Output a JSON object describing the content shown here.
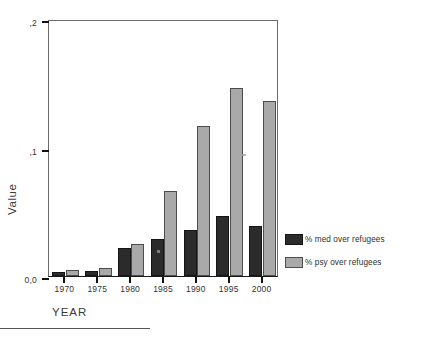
{
  "chart_data": {
    "type": "bar",
    "title": "",
    "subtitle": "",
    "xlabel": "YEAR",
    "ylabel": "Value",
    "categories": [
      "1970",
      "1975",
      "1980",
      "1985",
      "1990",
      "1995",
      "2000"
    ],
    "series": [
      {
        "name": "% med over refugees",
        "color": "#2b2b2b",
        "values": [
          0.003,
          0.004,
          0.022,
          0.029,
          0.036,
          0.047,
          0.039
        ]
      },
      {
        "name": "% psy over refugees",
        "color": "#a9a9a9",
        "values": [
          0.005,
          0.006,
          0.025,
          0.066,
          0.117,
          0.146,
          0.136
        ]
      }
    ],
    "ylim": [
      0.0,
      0.2
    ],
    "ytick_values": [
      0.0,
      0.1,
      0.2
    ],
    "ytick_labels": [
      "0,0",
      ",1",
      ",2"
    ],
    "grid": false,
    "legend_position": "right",
    "decimal_separator": ","
  },
  "axes": {
    "y_title": "Value",
    "x_title": "YEAR"
  },
  "legend": {
    "entries": [
      {
        "label": "% med over refugees",
        "swatch": "med"
      },
      {
        "label": "% psy over refugees",
        "swatch": "psy"
      }
    ]
  },
  "colors": {
    "series_med": "#2b2b2b",
    "series_psy": "#a9a9a9",
    "axis": "#111111",
    "frame": "#6b6b6b",
    "background": "#ffffff"
  }
}
